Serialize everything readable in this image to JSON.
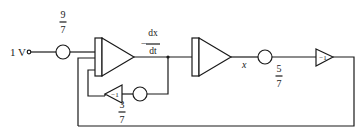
{
  "diagram": {
    "input": {
      "label": "1 V"
    },
    "coefficients": {
      "input_gain": {
        "numerator": "9",
        "denominator": "7"
      },
      "feedback_inner": {
        "numerator": "3",
        "denominator": "7"
      },
      "output_gain": {
        "numerator": "5",
        "denominator": "7"
      }
    },
    "signals": {
      "derivative": {
        "sign": "−",
        "numerator": "dx",
        "denominator": "dt"
      },
      "output": "x"
    },
    "inverters": {
      "inner": {
        "label": "−1"
      },
      "outer": {
        "label": "−1"
      }
    },
    "components": [
      "input-terminal",
      "coefficient-9-7",
      "integrator-1 (summing)",
      "integrator-2",
      "coefficient-5-7",
      "inverter-outer",
      "inverter-inner",
      "coefficient-3-7"
    ],
    "colors": {
      "ink": "#1a1a1a",
      "background": "#ffffff"
    }
  }
}
